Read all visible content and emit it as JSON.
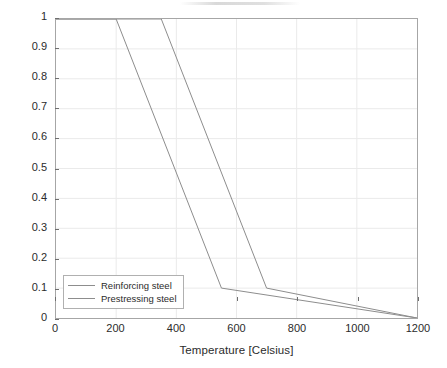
{
  "chart_data": {
    "type": "line",
    "title": "",
    "xlabel": "Temperature [Celsius]",
    "ylabel": "Strength reduction factor",
    "xlim": [
      0,
      1200
    ],
    "ylim": [
      0,
      1
    ],
    "xticks": [
      0,
      200,
      400,
      600,
      800,
      1000,
      1200
    ],
    "yticks": [
      0,
      0.1,
      0.2,
      0.3,
      0.4,
      0.5,
      0.6,
      0.7,
      0.8,
      0.9,
      1
    ],
    "xtick_labels": [
      "0",
      "200",
      "400",
      "600",
      "800",
      "1000",
      "1200"
    ],
    "ytick_labels": [
      "0",
      "0.1",
      "0.2",
      "0.3",
      "0.4",
      "0.5",
      "0.6",
      "0.7",
      "0.8",
      "0.9",
      "1"
    ],
    "grid": true,
    "legend_position": "lower left (inside axes)",
    "series": [
      {
        "name": "Reinforcing steel",
        "color": "#8d8d8d",
        "x": [
          0,
          200,
          550,
          1200
        ],
        "y": [
          1,
          1,
          0.1,
          0
        ]
      },
      {
        "name": "Prestressing steel",
        "color": "#8d8d8d",
        "x": [
          0,
          350,
          700,
          1200
        ],
        "y": [
          1,
          1,
          0.1,
          0
        ]
      }
    ]
  },
  "legend": {
    "items": [
      {
        "label": "Reinforcing steel"
      },
      {
        "label": "Prestressing steel"
      }
    ]
  },
  "colors": {
    "background": "#ffffff",
    "axis": "#a6a6a6",
    "grid": "#eaeaea",
    "text": "#2b2b2b",
    "series": "#8d8d8d"
  }
}
